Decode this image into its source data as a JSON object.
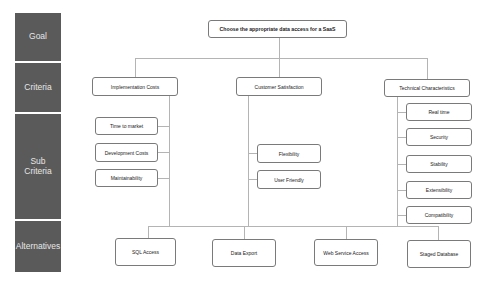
{
  "levels": [
    {
      "label": "Goal"
    },
    {
      "label": "Criteria"
    },
    {
      "label": "Sub Criteria"
    },
    {
      "label": "Alternatives"
    }
  ],
  "goal": {
    "label": "Choose the appropriate data access for a SaaS"
  },
  "criteria": [
    {
      "label": "Implementation Costs",
      "sub": [
        "Time to market",
        "Development Costs",
        "Maintainability"
      ]
    },
    {
      "label": "Customer Satisfaction",
      "sub": [
        "Flexibility",
        "User Friendly"
      ]
    },
    {
      "label": "Technical Characteristics",
      "sub": [
        "Real time",
        "Security",
        "Stability",
        "Extensibility",
        "Compatibility"
      ]
    }
  ],
  "alternatives": [
    "SQL Access",
    "Data Export",
    "Web Service Access",
    "Staged Database"
  ],
  "colors": {
    "band": "#5a5a5a",
    "band_text": "#e6e6e6",
    "border": "#7a7a7a",
    "connector": "#b4b4b4"
  }
}
